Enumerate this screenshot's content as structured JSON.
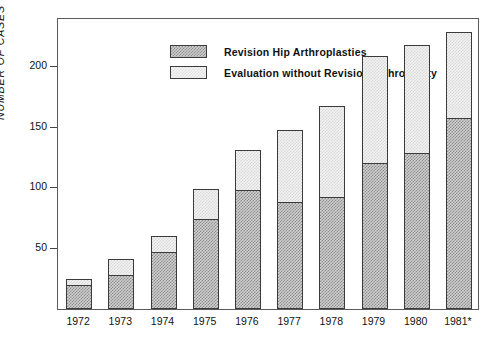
{
  "chart_data": {
    "type": "bar",
    "title": "",
    "subtitle": "",
    "xlabel": "",
    "ylabel": "NUMBER OF CASES",
    "categories": [
      "1972",
      "1973",
      "1974",
      "1975",
      "1976",
      "1977",
      "1978",
      "1979",
      "1980",
      "1981*"
    ],
    "ylim": [
      0,
      240
    ],
    "yticks": [
      50,
      100,
      150,
      200
    ],
    "ytick_labels": [
      "50",
      "100",
      "150",
      "200"
    ],
    "grid": false,
    "stacked": true,
    "legend_position": "top-left-inside",
    "series": [
      {
        "name": "Revision Hip Arthroplasties",
        "values": [
          20,
          28,
          47,
          74,
          98,
          88,
          92,
          120,
          128,
          157
        ]
      },
      {
        "name": "Evaluation without Revision Arthroplasty",
        "values": [
          5,
          13,
          13,
          25,
          33,
          59,
          75,
          88,
          89,
          71
        ]
      }
    ],
    "totals": [
      25,
      41,
      60,
      99,
      131,
      147,
      167,
      208,
      217,
      228
    ],
    "annotations": [
      "1981 value marked with an asterisk"
    ]
  },
  "legend": {
    "items": [
      {
        "label": "Revision Hip Arthroplasties",
        "swatch": "revision"
      },
      {
        "label": "Evaluation without Revision Arthroplasty",
        "swatch": "evaluation"
      }
    ]
  },
  "colors": {
    "revision_fill": "#cfcfcf",
    "revision_hatch": "#8e8e8e",
    "evaluation_fill": "#f2f2f2",
    "evaluation_hatch": "#d8d8d8",
    "axis": "#5a5a5a",
    "text": "#111111"
  }
}
